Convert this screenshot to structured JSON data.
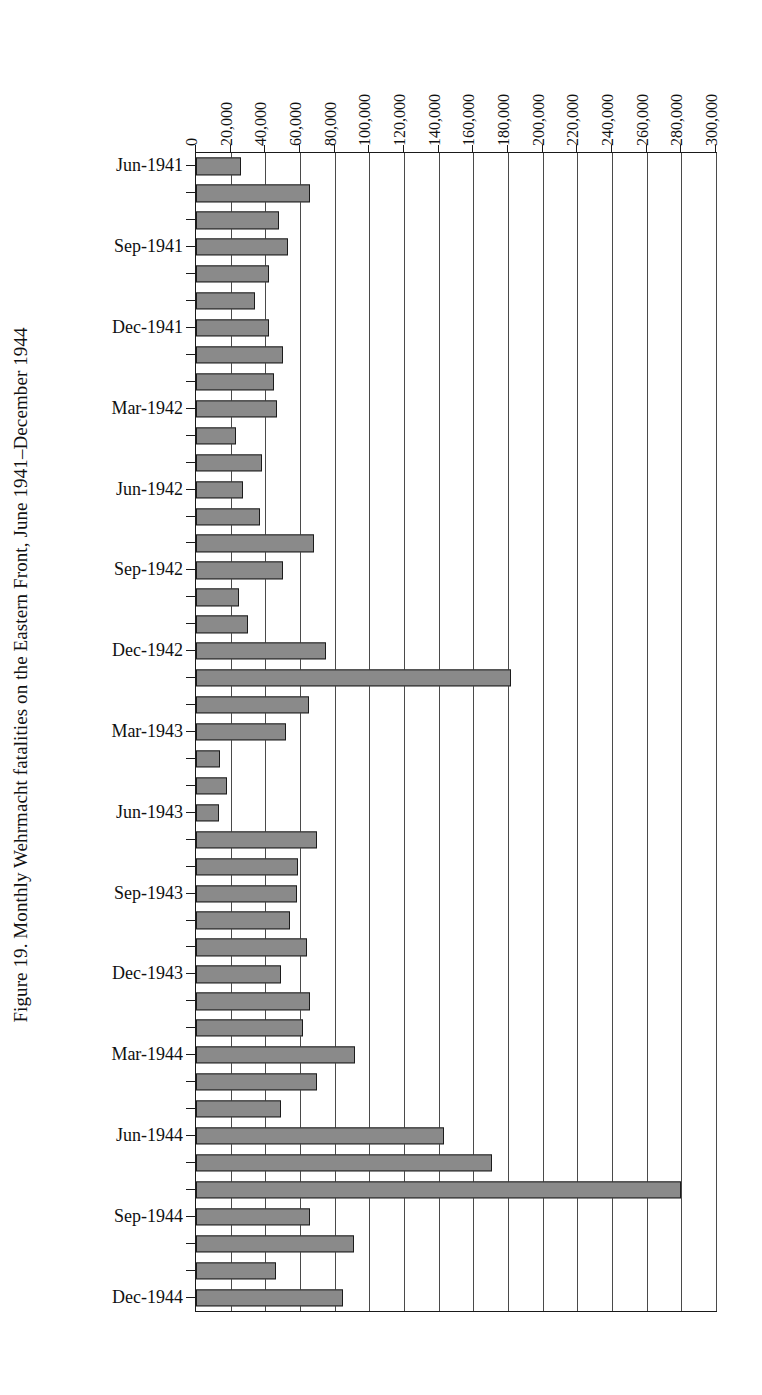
{
  "figure": {
    "caption": "Figure 19. Monthly Wehrmacht fatalities on the Eastern Front, June 1941–December 1944"
  },
  "chart_data": {
    "type": "bar",
    "orientation": "horizontal",
    "title": "Figure 19. Monthly Wehrmacht fatalities on the Eastern Front, June 1941–December 1944",
    "xlabel": "",
    "ylabel": "",
    "xlim": [
      0,
      300000
    ],
    "xticks": [
      0,
      20000,
      40000,
      60000,
      80000,
      100000,
      120000,
      140000,
      160000,
      180000,
      200000,
      220000,
      240000,
      260000,
      280000,
      300000
    ],
    "xtick_labels": [
      "0",
      "20,000",
      "40,000",
      "60,000",
      "80,000",
      "100,000",
      "120,000",
      "140,000",
      "160,000",
      "180,000",
      "200,000",
      "220,000",
      "240,000",
      "260,000",
      "280,000",
      "300,000"
    ],
    "grid": true,
    "legend": false,
    "bar_color": "#8a8a8a",
    "bar_edge_color": "#1c1c1c",
    "labeled_categories": [
      "Jun-1941",
      "Sep-1941",
      "Dec-1941",
      "Mar-1942",
      "Jun-1942",
      "Sep-1942",
      "Dec-1942",
      "Mar-1943",
      "Jun-1943",
      "Sep-1943",
      "Dec-1943",
      "Mar-1944",
      "Jun-1944",
      "Sep-1944",
      "Dec-1944"
    ],
    "categories": [
      "Jun-1941",
      "Jul-1941",
      "Aug-1941",
      "Sep-1941",
      "Oct-1941",
      "Nov-1941",
      "Dec-1941",
      "Jan-1942",
      "Feb-1942",
      "Mar-1942",
      "Apr-1942",
      "May-1942",
      "Jun-1942",
      "Jul-1942",
      "Aug-1942",
      "Sep-1942",
      "Oct-1942",
      "Nov-1942",
      "Dec-1942",
      "Jan-1943",
      "Feb-1943",
      "Mar-1943",
      "Apr-1943",
      "May-1943",
      "Jun-1943",
      "Jul-1943",
      "Aug-1943",
      "Sep-1943",
      "Oct-1943",
      "Nov-1943",
      "Dec-1943",
      "Jan-1944",
      "Feb-1944",
      "Mar-1944",
      "Apr-1944",
      "May-1944",
      "Jun-1944",
      "Jul-1944",
      "Aug-1944",
      "Sep-1944",
      "Oct-1944",
      "Nov-1944",
      "Dec-1944"
    ],
    "values": [
      26000,
      66000,
      48000,
      53000,
      42000,
      34000,
      42000,
      50000,
      45000,
      47000,
      23000,
      38000,
      27000,
      37000,
      68000,
      50000,
      25000,
      30000,
      75000,
      182000,
      65000,
      52000,
      14000,
      18000,
      13000,
      70000,
      59000,
      58000,
      54000,
      64000,
      49000,
      66000,
      62000,
      92000,
      70000,
      49000,
      143000,
      171000,
      280000,
      66000,
      91000,
      46000,
      85000
    ]
  }
}
